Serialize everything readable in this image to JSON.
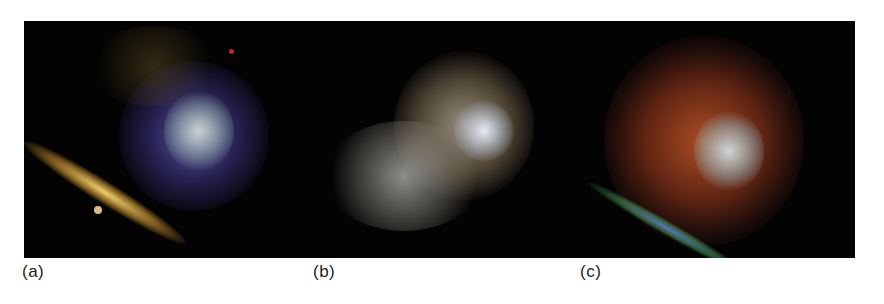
{
  "figure": {
    "panels": [
      {
        "label": "(a)",
        "description": "nebula composite, blue/violet with yellow-orange ridge"
      },
      {
        "label": "(b)",
        "description": "nebula in grey/brown tones"
      },
      {
        "label": "(c)",
        "description": "nebula in red/orange with blue-green rim"
      }
    ]
  }
}
